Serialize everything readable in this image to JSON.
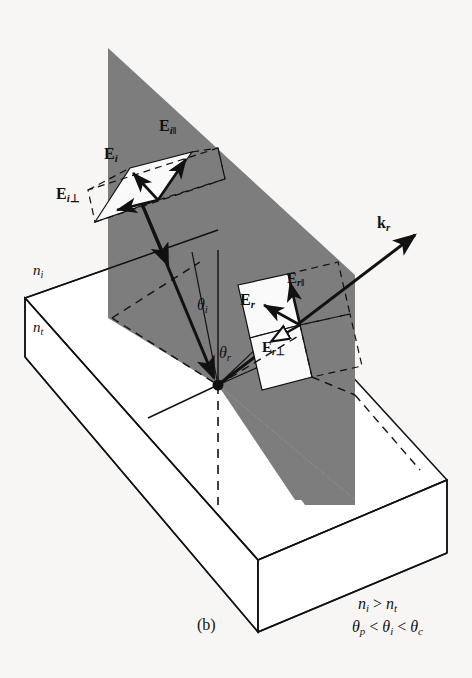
{
  "figure": {
    "caption": "(b)",
    "colors": {
      "plane_of_incidence_fill": "#7d7d7d",
      "background": "#f7f6f4",
      "stroke": "#111111",
      "slab_fill": "#ffffff",
      "field_patch_fill": "#fafafa"
    }
  },
  "labels": {
    "incident_field": "E",
    "incident_field_sub": "i",
    "incident_parallel": "E",
    "incident_parallel_sub": "i",
    "incident_parallel_mark": "‖",
    "incident_perp": "E",
    "incident_perp_sub": "i",
    "incident_perp_mark": "⊥",
    "reflected_field": "E",
    "reflected_field_sub": "r",
    "reflected_parallel": "E",
    "reflected_parallel_sub": "r",
    "reflected_parallel_mark": "‖",
    "reflected_perp": "E",
    "reflected_perp_sub": "r",
    "reflected_perp_mark": "⊥",
    "wavevector_reflected": "k",
    "wavevector_reflected_sub": "r",
    "angle_incidence": "θ",
    "angle_incidence_sub": "i",
    "angle_reflection": "θ",
    "angle_reflection_sub": "r",
    "index_incident": "n",
    "index_incident_sub": "i",
    "index_transmitted": "n",
    "index_transmitted_sub": "t"
  },
  "conditions": {
    "line1": "nᵢ > nₜ",
    "line2": "θₚ < θᵢ < θᶜ",
    "line1_parts": {
      "lhs": "n",
      "lhs_sub": "i",
      "op": ">",
      "rhs": "n",
      "rhs_sub": "t"
    },
    "line2_parts": {
      "a": "θ",
      "a_sub": "p",
      "op1": "<",
      "b": "θ",
      "b_sub": "i",
      "op2": "<",
      "c": "θ",
      "c_sub": "c"
    }
  },
  "geometry": {
    "incidence_point": {
      "x": 218,
      "y": 385
    },
    "plane_of_incidence_polygon": "108,48 355,275 355,500 218,385 108,318",
    "slab_top_face": "25,298 258,560 447,480 218,230",
    "slab_thickness_px": 72,
    "normal_above_x": 218,
    "normal_above_y_top": 250,
    "normal_below_dash_y": 505
  },
  "vectors": {
    "incident_ray": {
      "from": {
        "x": 143,
        "y": 207
      },
      "to": {
        "x": 218,
        "y": 385
      },
      "style": "solid-arrow"
    },
    "reflected_ray": {
      "from": {
        "x": 218,
        "y": 385
      },
      "to": {
        "x": 418,
        "y": 232
      },
      "style": "solid-arrow"
    },
    "E_i_arrow": {
      "style": "solid-arrow",
      "direction": "up-left"
    },
    "E_i_parallel_arrow": {
      "style": "solid-arrow",
      "direction": "up-right"
    },
    "E_i_perp_arrow": {
      "style": "solid-arrow",
      "direction": "left"
    },
    "E_r_arrow": {
      "style": "solid-arrow",
      "direction": "up-left"
    },
    "E_r_parallel_arrow": {
      "style": "solid-arrow",
      "direction": "up"
    },
    "E_r_perp_arrow": {
      "style": "hollow-arrow",
      "direction": "down-left"
    }
  }
}
